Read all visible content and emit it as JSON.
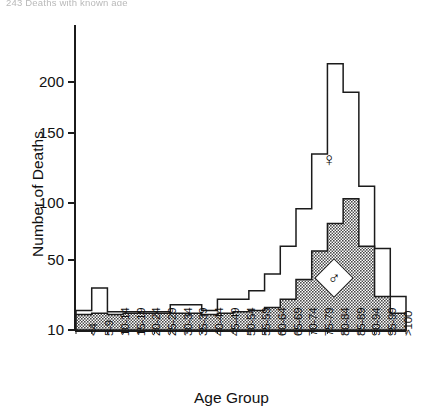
{
  "top_caption": "243 Deaths with known age",
  "chart_data": {
    "type": "bar",
    "title": "",
    "xlabel": "Age Group",
    "ylabel": "Number of Deaths",
    "grid": false,
    "legend_position": "inside-plot",
    "yticks": [
      10,
      50,
      100,
      150,
      200
    ],
    "ylim": [
      10,
      230
    ],
    "y_axis_note": "non-linear: compressed below 50, baseline floor at 10",
    "categories": [
      "<4",
      "5-9",
      "10-14",
      "15-19",
      "20-24",
      "25-29",
      "30-34",
      "35-39",
      "40-44",
      "45-49",
      "50-54",
      "55-59",
      "60-64",
      "65-69",
      "70-74",
      "75-79",
      "80-84",
      "85-89",
      "90-94",
      "95-99",
      ">100"
    ],
    "series": [
      {
        "name": "Female",
        "symbol": "♀",
        "style": "outline",
        "fill": "#ffffff",
        "stroke": "#1b1b1b",
        "values": [
          14,
          30,
          13,
          13,
          13,
          13,
          18,
          18,
          14,
          22,
          22,
          28,
          40,
          62,
          95,
          135,
          218,
          190,
          112,
          60,
          24
        ]
      },
      {
        "name": "Male",
        "symbol": "♂",
        "style": "stippled",
        "fill": "#9a9a9a",
        "stroke": "#1b1b1b",
        "values": [
          11,
          12,
          11,
          12,
          12,
          12,
          12,
          12,
          11,
          12,
          13,
          14,
          16,
          22,
          36,
          58,
          82,
          103,
          62,
          24,
          12
        ]
      }
    ],
    "annotations": [
      {
        "text": "♀",
        "name": "female-symbol",
        "x_category": "75-79",
        "y_value": 140
      },
      {
        "text": "♂",
        "name": "male-symbol",
        "x_category": "80-84",
        "y_value": 55
      }
    ]
  },
  "axis": {
    "y_title": "Number of Deaths",
    "x_title": "Age Group"
  }
}
